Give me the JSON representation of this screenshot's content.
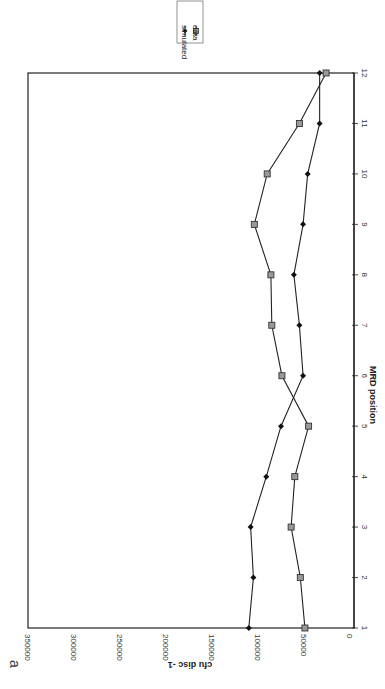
{
  "panel_label": "a",
  "legend": {
    "items": [
      {
        "label": "simulated",
        "marker": "diamond",
        "color": "#111111"
      },
      {
        "label": "data",
        "marker": "square",
        "color": "#888888"
      }
    ]
  },
  "axes": {
    "x_title": "MRD position",
    "y_title": "cfu disc -1",
    "x_ticks": [
      "1",
      "2",
      "3",
      "4",
      "5",
      "6",
      "7",
      "8",
      "9",
      "10",
      "11",
      "12"
    ],
    "y_ticks": [
      "0",
      "50000",
      "100000",
      "150000",
      "200000",
      "250000",
      "300000",
      "350000"
    ]
  },
  "chart_data": {
    "type": "line",
    "title": "",
    "xlabel": "MRD position",
    "ylabel": "cfu disc -1",
    "x": [
      1,
      2,
      3,
      4,
      5,
      6,
      7,
      8,
      9,
      10,
      11,
      12
    ],
    "ylim": [
      0,
      350000
    ],
    "grid": false,
    "legend_position": "outside top-right (rotated figure)",
    "orientation": "figure rotated 90 degrees on page",
    "series": [
      {
        "name": "simulated",
        "marker": "diamond",
        "values": [
          110000,
          105000,
          108000,
          91000,
          75000,
          51000,
          55000,
          61000,
          51000,
          46000,
          33000,
          33000
        ]
      },
      {
        "name": "data",
        "marker": "square",
        "values": [
          49000,
          54000,
          64000,
          60000,
          45000,
          74000,
          85000,
          86000,
          104000,
          90000,
          55000,
          26000
        ]
      }
    ]
  }
}
